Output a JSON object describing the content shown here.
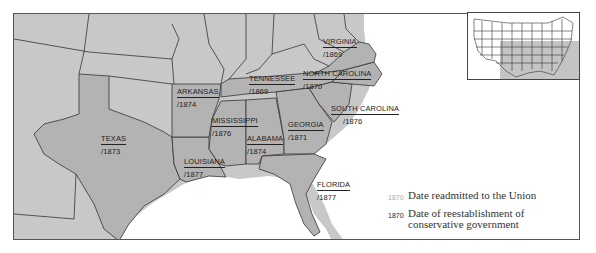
{
  "map": {
    "colors": {
      "background_land": "#c8c8c8",
      "confederate_land": "#b4b4b4",
      "water": "#ffffff",
      "border": "#333333",
      "readmit_text": "#a9a9a9",
      "conservative_text": "#222222"
    },
    "states": [
      {
        "id": "virginia",
        "name": "VIRGINIA",
        "readmitted": "",
        "conservative": "/1869"
      },
      {
        "id": "north-carolina",
        "name": "NORTH CAROLINA",
        "readmitted": "",
        "conservative": "/1870"
      },
      {
        "id": "tennessee",
        "name": "TENNESSEE",
        "readmitted": "",
        "conservative": "/1869"
      },
      {
        "id": "arkansas",
        "name": "ARKANSAS",
        "readmitted": "",
        "conservative": "/1874"
      },
      {
        "id": "south-carolina",
        "name": "SOUTH CAROLINA",
        "readmitted": "",
        "conservative": "/1876"
      },
      {
        "id": "mississippi",
        "name": "MISSISSIPPI",
        "readmitted": "",
        "conservative": "/1876"
      },
      {
        "id": "georgia",
        "name": "GEORGIA",
        "readmitted": "",
        "conservative": "/1871"
      },
      {
        "id": "alabama",
        "name": "ALABAMA",
        "readmitted": "",
        "conservative": "/1874"
      },
      {
        "id": "texas",
        "name": "TEXAS",
        "readmitted": "",
        "conservative": "/1873"
      },
      {
        "id": "louisiana",
        "name": "LOUISIANA",
        "readmitted": "",
        "conservative": "/1877"
      },
      {
        "id": "florida",
        "name": "FLORIDA",
        "readmitted": "",
        "conservative": "/1877"
      }
    ]
  },
  "legend": {
    "items": [
      {
        "year": "1870",
        "style": "light",
        "label": "Date readmitted to the Union"
      },
      {
        "year": "1870",
        "style": "dark",
        "label": "Date of reestablishment of conservative government"
      }
    ]
  },
  "inset": {
    "label": "United States locator map",
    "highlight_color": "#c4c4c4"
  }
}
